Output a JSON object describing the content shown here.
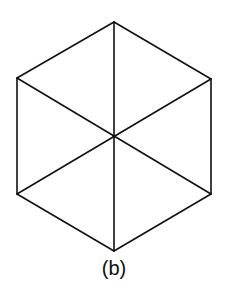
{
  "figure": {
    "caption": "(b)",
    "stroke_color": "#111111",
    "background_color": "#ffffff",
    "vertices": {
      "top": [
        114,
        22
      ],
      "upper_right": [
        211,
        79
      ],
      "lower_right": [
        211,
        194
      ],
      "bottom": [
        114,
        251
      ],
      "lower_left": [
        17,
        194
      ],
      "upper_left": [
        17,
        78
      ],
      "center": [
        114,
        136
      ]
    },
    "edges": [
      {
        "name": "edge-top-upper-right",
        "from": "top",
        "to": "upper_right"
      },
      {
        "name": "edge-upper-right-lower-right",
        "from": "upper_right",
        "to": "lower_right"
      },
      {
        "name": "edge-lower-right-bottom",
        "from": "lower_right",
        "to": "bottom"
      },
      {
        "name": "edge-bottom-lower-left",
        "from": "bottom",
        "to": "lower_left"
      },
      {
        "name": "edge-lower-left-upper-left",
        "from": "lower_left",
        "to": "upper_left"
      },
      {
        "name": "edge-upper-left-top",
        "from": "upper_left",
        "to": "top"
      }
    ],
    "diagonals": [
      {
        "name": "diagonal-vertical",
        "from": "top",
        "to": "bottom"
      },
      {
        "name": "diagonal-upper-left-lower-right",
        "from": "upper_left",
        "to": "lower_right"
      },
      {
        "name": "diagonal-lower-left-upper-right",
        "from": "lower_left",
        "to": "upper_right"
      }
    ]
  }
}
